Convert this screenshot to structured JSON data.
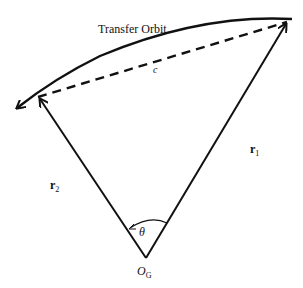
{
  "diagram": {
    "title": "Transfer Orbit",
    "chord_label": "c",
    "r1_label": "r",
    "r1_sub": "1",
    "r2_label": "r",
    "r2_sub": "2",
    "angle_label": "θ",
    "origin_label": "O",
    "origin_sub": "G"
  },
  "colors": {
    "stroke": "#111111",
    "background": "#ffffff"
  }
}
